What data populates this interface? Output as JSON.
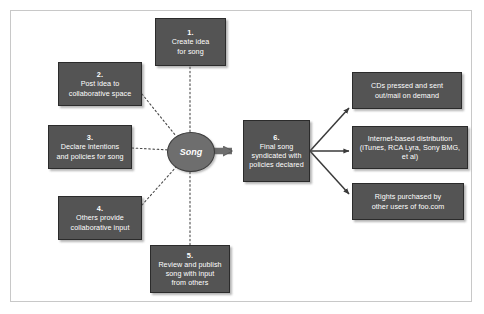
{
  "diagram": {
    "hub": {
      "label": "Song"
    },
    "colors": {
      "node_fill": "#545454",
      "node_border": "#2b2b2b",
      "hub_fill": "#6e6e6e",
      "text": "#ffffff",
      "connector": "#3a3a3a",
      "frame": "#c8c8c8",
      "background": "#ffffff"
    },
    "inputs": [
      {
        "number": "1.",
        "text": "Create idea\nfor song",
        "connector": "dotted"
      },
      {
        "number": "2.",
        "text": "Post idea to\ncollaborative space",
        "connector": "dotted"
      },
      {
        "number": "3.",
        "text": "Declare intentions\nand policies for song",
        "connector": "dotted"
      },
      {
        "number": "4.",
        "text": "Others provide\ncollaborative input",
        "connector": "dotted"
      },
      {
        "number": "5.",
        "text": "Review and publish\nsong with input\nfrom others",
        "connector": "dotted"
      }
    ],
    "output": {
      "number": "6.",
      "text": "Final song\nsyndicated with\npolicies declared",
      "connector": "solid-arrow"
    },
    "channels": [
      {
        "text": "CDs pressed and sent\nout/mail on demand",
        "connector": "solid-arrow"
      },
      {
        "text": "Internet-based distribution\n(iTunes, RCA Lyra, Sony BMG,\net al)",
        "connector": "solid-arrow"
      },
      {
        "text": "Rights purchased by\nother users of foo.com",
        "connector": "solid-arrow"
      }
    ]
  }
}
